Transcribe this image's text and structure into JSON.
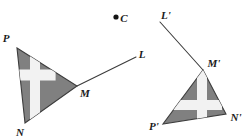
{
  "figure": {
    "background_color": "#ffffff",
    "shape_fill_color": "#808080",
    "shape_stroke_color": "#3c3c3c",
    "cross_color": "#f2f2f2",
    "label_color": "#1b1b1b",
    "width": 251,
    "height": 138
  },
  "center_point": {
    "name": "C",
    "label": "C",
    "dot_x": 116,
    "dot_y": 17,
    "label_x": 122,
    "label_y": 21,
    "dot_radius": 2.6
  },
  "preimage": {
    "name": "triangle-PMN",
    "vertices": [
      {
        "name": "P",
        "label": "P",
        "x": 17,
        "y": 48,
        "label_x": 6,
        "label_y": 42
      },
      {
        "name": "M",
        "label": "M",
        "x": 77,
        "y": 86,
        "label_x": 81,
        "label_y": 97
      },
      {
        "name": "N",
        "label": "N",
        "x": 25,
        "y": 123,
        "label_x": 18,
        "label_y": 135
      }
    ],
    "polygon_points": "17,48 77,86 25,123",
    "cross": {
      "horizontal_band": "14.8,69.6 55.6,69.6 55.6,80.4 14.8,80.4",
      "vertical_band": "30.0,44.0 40.0,44.0 40.0,126.0 30.0,126.0"
    },
    "ray": {
      "name": "ray-ML",
      "from_x": 77,
      "from_y": 86,
      "to_x": 136,
      "to_y": 57,
      "endpoint_label": "L",
      "label_x": 140,
      "label_y": 58
    }
  },
  "image": {
    "name": "triangle-P-prime-M-prime-N-prime",
    "vertices": [
      {
        "name": "M-prime",
        "label": "M'",
        "x": 203,
        "y": 70,
        "label_x": 208,
        "label_y": 65
      },
      {
        "name": "N-prime",
        "label": "N'",
        "x": 226,
        "y": 114,
        "label_x": 230,
        "label_y": 120
      },
      {
        "name": "P-prime",
        "label": "P'",
        "x": 163,
        "y": 124,
        "label_x": 148,
        "label_y": 129
      }
    ],
    "polygon_points": "203,70 226,114 163,124",
    "cross": {
      "horizontal_band": "167.0,100.0 222.0,100.0 222.0,110.0 167.0,110.0",
      "vertical_band": "197.0,70.0 207.0,70.0 207.0,124.0 197.0,124.0"
    },
    "ray": {
      "name": "ray-M-prime-L-prime",
      "from_x": 203,
      "from_y": 70,
      "to_x": 160,
      "to_y": 22,
      "endpoint_label": "L'",
      "label_x": 163,
      "label_y": 18
    }
  }
}
